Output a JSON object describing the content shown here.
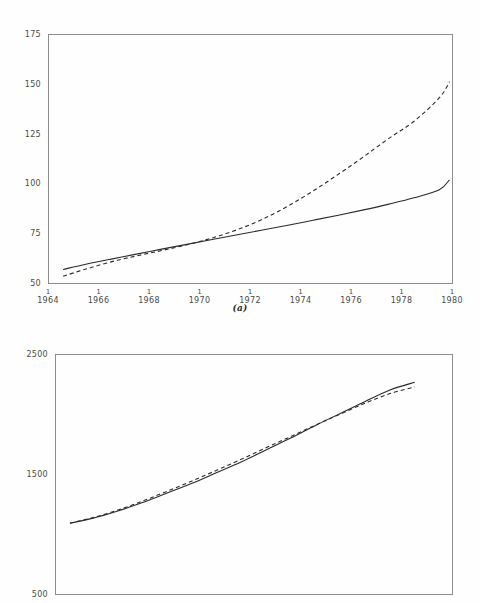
{
  "figures": [
    {
      "id": "a",
      "caption": "(a)",
      "chart_ref": 0
    },
    {
      "id": "b",
      "caption": "",
      "chart_ref": 1
    }
  ],
  "chart_data": [
    {
      "type": "line",
      "title": "",
      "subtitle": "",
      "xlabel": "",
      "ylabel": "",
      "caption": "(a)",
      "grid": false,
      "legend": "none",
      "xlim": [
        1964,
        1980
      ],
      "ylim": [
        50,
        175
      ],
      "xticks": [
        1964,
        1966,
        1968,
        1970,
        1972,
        1974,
        1976,
        1978,
        1980
      ],
      "xtick_labels": [
        "1964",
        "1966",
        "1968",
        "1970",
        "1972",
        "1974",
        "1976",
        "1978",
        "1980"
      ],
      "xtick_period_labels": [
        "1",
        "1",
        "1",
        "1",
        "1",
        "1",
        "1",
        "1",
        "1"
      ],
      "yticks": [
        50,
        75,
        100,
        125,
        150,
        175
      ],
      "ytick_labels": [
        "50",
        "75",
        "100",
        "125",
        "150",
        "175"
      ],
      "x": [
        1964.6,
        1965.5,
        1966.5,
        1967.5,
        1968.5,
        1969.5,
        1970.5,
        1971.5,
        1972.5,
        1973.5,
        1974.5,
        1975.5,
        1976.5,
        1977.5,
        1978.5,
        1979.5,
        1979.9
      ],
      "series": [
        {
          "name": "solid",
          "style": "solid",
          "values": [
            56.8,
            59.4,
            62.0,
            64.5,
            67.0,
            69.4,
            71.8,
            74.2,
            76.6,
            79.0,
            81.5,
            84.0,
            86.7,
            89.6,
            92.8,
            96.8,
            101.8
          ]
        },
        {
          "name": "dashed",
          "style": "dashed",
          "values": [
            53.4,
            57.0,
            60.6,
            63.6,
            66.3,
            69.2,
            72.6,
            76.8,
            82.0,
            88.6,
            96.2,
            104.6,
            113.4,
            122.6,
            131.2,
            143.0,
            151.0
          ]
        }
      ]
    },
    {
      "type": "line",
      "title": "",
      "subtitle": "",
      "xlabel": "",
      "ylabel": "",
      "caption": "",
      "grid": false,
      "legend": "none",
      "xlim": [
        1964,
        1980
      ],
      "ylim": [
        500,
        2500
      ],
      "xticks": [],
      "xtick_labels": [],
      "xtick_period_labels": [],
      "yticks": [
        500,
        1500,
        2500
      ],
      "ytick_labels": [
        "500",
        "1500",
        "2500"
      ],
      "x": [
        1964.6,
        1965.5,
        1966.5,
        1967.5,
        1968.5,
        1969.5,
        1970.5,
        1971.5,
        1972.5,
        1973.5,
        1974.5,
        1975.5,
        1976.5,
        1977.5,
        1978.5
      ],
      "series": [
        {
          "name": "solid",
          "style": "solid",
          "values": [
            1090,
            1130,
            1190,
            1260,
            1340,
            1420,
            1510,
            1600,
            1700,
            1800,
            1905,
            2005,
            2105,
            2200,
            2265
          ]
        },
        {
          "name": "dashed",
          "style": "dashed",
          "values": [
            1090,
            1135,
            1197,
            1272,
            1355,
            1440,
            1530,
            1622,
            1718,
            1812,
            1908,
            2000,
            2090,
            2170,
            2225
          ]
        }
      ]
    }
  ]
}
